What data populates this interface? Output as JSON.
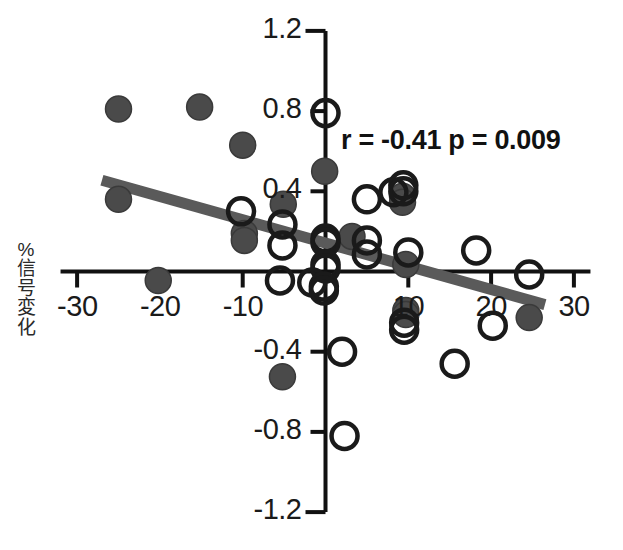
{
  "chart_data": {
    "type": "scatter",
    "title": "",
    "subtitle": "",
    "xlabel": "",
    "ylabel": "%信号変化",
    "ylabel_chars": [
      "%",
      "信",
      "号",
      "変",
      "化"
    ],
    "xlim": [
      -32,
      32
    ],
    "ylim": [
      -1.2,
      1.2
    ],
    "grid": false,
    "legend_position": "none",
    "x_ticks": [
      -30,
      -20,
      -10,
      10,
      20,
      30
    ],
    "x_tick_labels": [
      "-30",
      "-20",
      "-10",
      "10",
      "20",
      "30"
    ],
    "y_ticks": [
      1.2,
      0.8,
      0.4,
      -0.4,
      -0.8,
      -1.2
    ],
    "y_tick_labels": [
      "1.2",
      "0.8",
      "0.4",
      "-0.4",
      "-0.8",
      "-1.2"
    ],
    "annotation": "r = -0.41 p = 0.009",
    "statistics": {
      "r": "-0.41",
      "p": "0.009"
    },
    "trendline": {
      "label": "regression line",
      "x_start": -27.0,
      "y_start": 0.455,
      "x_end": 26.5,
      "y_end": -0.165,
      "color": "#5a5a5a",
      "width_px": 11
    },
    "series": [
      {
        "name": "filled",
        "marker": "filled-circle",
        "color": "#4a4a4a",
        "points": [
          {
            "x": -25.0,
            "y": 0.81
          },
          {
            "x": -15.2,
            "y": 0.82
          },
          {
            "x": -10.0,
            "y": 0.63
          },
          {
            "x": -25.0,
            "y": 0.36
          },
          {
            "x": -20.2,
            "y": -0.045
          },
          {
            "x": -9.8,
            "y": 0.19
          },
          {
            "x": -9.8,
            "y": 0.155
          },
          {
            "x": -5.1,
            "y": 0.335
          },
          {
            "x": -0.1,
            "y": 0.5
          },
          {
            "x": 9.3,
            "y": 0.375
          },
          {
            "x": 9.3,
            "y": 0.345
          },
          {
            "x": 3.2,
            "y": 0.175
          },
          {
            "x": 9.7,
            "y": 0.035
          },
          {
            "x": 9.7,
            "y": -0.195
          },
          {
            "x": 9.7,
            "y": -0.215
          },
          {
            "x": 24.6,
            "y": -0.23
          },
          {
            "x": -5.2,
            "y": -0.525
          }
        ]
      },
      {
        "name": "open",
        "marker": "open-circle",
        "color": "#1a1a1a",
        "points": [
          {
            "x": 0.0,
            "y": 0.79
          },
          {
            "x": -10.2,
            "y": 0.3
          },
          {
            "x": 5.0,
            "y": 0.36
          },
          {
            "x": 8.2,
            "y": 0.395
          },
          {
            "x": 9.4,
            "y": 0.43
          },
          {
            "x": 9.4,
            "y": 0.4
          },
          {
            "x": -5.2,
            "y": 0.235
          },
          {
            "x": -5.2,
            "y": 0.13
          },
          {
            "x": 0.0,
            "y": 0.165
          },
          {
            "x": 0.0,
            "y": 0.145
          },
          {
            "x": 5.0,
            "y": 0.155
          },
          {
            "x": 5.0,
            "y": 0.085
          },
          {
            "x": 10.0,
            "y": 0.095
          },
          {
            "x": 18.2,
            "y": 0.105
          },
          {
            "x": 0.0,
            "y": 0.035
          },
          {
            "x": 0.0,
            "y": 0.015
          },
          {
            "x": -1.6,
            "y": -0.055
          },
          {
            "x": -0.2,
            "y": -0.075
          },
          {
            "x": -0.2,
            "y": -0.095
          },
          {
            "x": 24.6,
            "y": -0.015
          },
          {
            "x": -5.5,
            "y": -0.045
          },
          {
            "x": 9.5,
            "y": -0.255
          },
          {
            "x": 9.5,
            "y": -0.29
          },
          {
            "x": 20.2,
            "y": -0.27
          },
          {
            "x": 2.0,
            "y": -0.4
          },
          {
            "x": 15.6,
            "y": -0.46
          },
          {
            "x": 2.3,
            "y": -0.82
          }
        ]
      }
    ]
  }
}
